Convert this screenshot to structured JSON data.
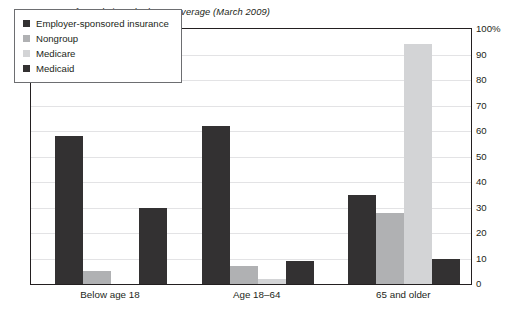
{
  "chart_data": {
    "type": "bar",
    "title": "Percentage of population who have coverage (March 2009)",
    "xlabel": "",
    "ylabel": "",
    "categories": [
      "Below age 18",
      "Age 18–64",
      "65 and older"
    ],
    "series": [
      {
        "name": "Employer-sponsored insurance",
        "color": "#333132",
        "values": [
          58,
          62,
          35
        ]
      },
      {
        "name": "Nongroup",
        "color": "#b0b1b3",
        "values": [
          5,
          7,
          28
        ]
      },
      {
        "name": "Medicare",
        "color": "#d3d4d6",
        "values": [
          0,
          2,
          94
        ]
      },
      {
        "name": "Medicaid",
        "color": "#333132",
        "values": [
          30,
          9,
          10
        ]
      }
    ],
    "ylim": [
      0,
      100
    ],
    "ytick_values": [
      0,
      10,
      20,
      30,
      40,
      50,
      60,
      70,
      80,
      90,
      100
    ],
    "ytick_labels": [
      "0",
      "10",
      "20",
      "30",
      "40",
      "50",
      "60",
      "70",
      "80",
      "90",
      "100%"
    ],
    "yaxis_position": "right",
    "grid": true,
    "grid_axis": "y",
    "grid_color": "#e3e3e5",
    "legend_position": "upper-left-inside",
    "legend_boxed": true,
    "frame_color": "#231f20",
    "background": "#ffffff"
  },
  "legend": {
    "entries": [
      {
        "label": "Employer-sponsored insurance"
      },
      {
        "label": "Nongroup"
      },
      {
        "label": "Medicare"
      },
      {
        "label": "Medicaid"
      }
    ]
  }
}
